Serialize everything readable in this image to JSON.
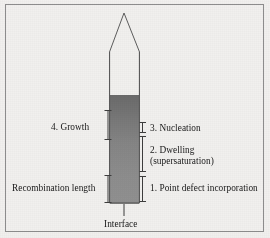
{
  "figure": {
    "background_color": "#f1f0ee",
    "frame_color": "#8d8d8d",
    "line_color": "#4a4a4a",
    "text_color": "#171717"
  },
  "crystal": {
    "name": "tapered crystal boule with melt interface",
    "tip_apex": {
      "x": 124,
      "y": 13
    },
    "shoulder_y": 52,
    "body_left_x": 110,
    "body_right_x": 139,
    "body_bottom_y": 203,
    "gradient_top_y": 95,
    "gradient_top_color": "#6f6f6f",
    "gradient_bottom_color": "#8e8e8e",
    "outline_color": "#595959"
  },
  "labels": {
    "growth": "4. Growth",
    "recombination_length": "Recombination length",
    "nucleation": "3. Nucleation",
    "dwelling_line1": "2. Dwelling",
    "dwelling_line2": "(supersaturation)",
    "point_defect": "1. Point defect incorporation",
    "interface": "Interface"
  },
  "brackets": {
    "left": [
      {
        "name": "growth-bracket",
        "x": 108,
        "top_y": 110,
        "bottom_y": 140,
        "label": "4. Growth"
      },
      {
        "name": "recombination-length-bracket",
        "x": 108,
        "top_y": 175,
        "bottom_y": 203,
        "label": "Recombination length"
      }
    ],
    "right": [
      {
        "name": "nucleation-bracket",
        "x": 143,
        "top_y": 122,
        "bottom_y": 133,
        "label": "3. Nucleation"
      },
      {
        "name": "dwelling-bracket",
        "x": 143,
        "top_y": 136,
        "bottom_y": 172,
        "label": "2. Dwelling (supersaturation)"
      },
      {
        "name": "point-defect-bracket",
        "x": 143,
        "top_y": 176,
        "bottom_y": 202,
        "label": "1. Point defect incorporation"
      }
    ]
  },
  "leader": {
    "name": "interface-leader-line",
    "x": 124,
    "top_y": 204,
    "bottom_y": 216
  }
}
